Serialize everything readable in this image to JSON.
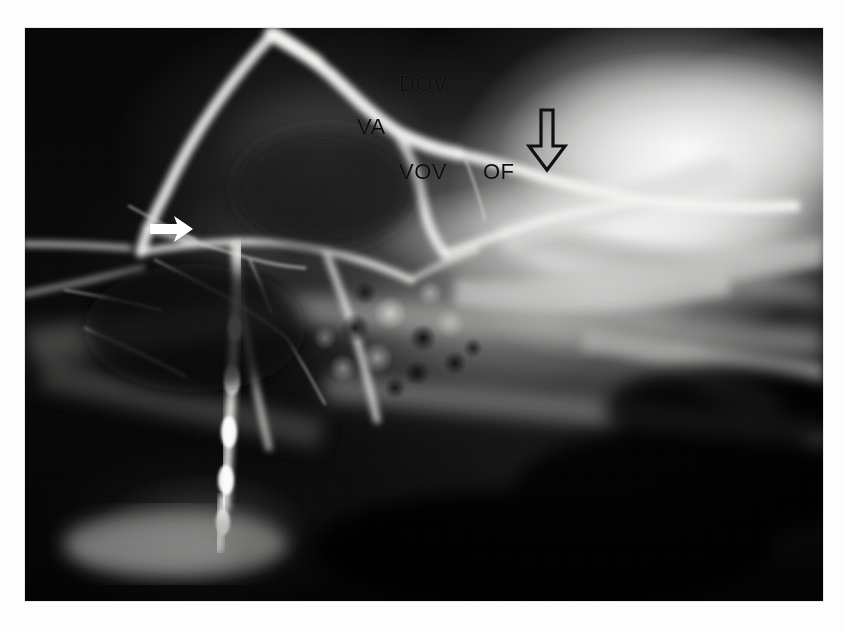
{
  "figure": {
    "kind": "radiograph",
    "modality": "venography / angiogram",
    "projection": "lateral head and neck",
    "background_color": "#ffffff",
    "plate_color": "#050505",
    "label_color": "#111111",
    "marker_color": "#ffffff"
  },
  "labels": [
    {
      "id": "dov",
      "text": "DOV",
      "x": 399,
      "y": 81,
      "meaning": "dorsal ophthalmic vein"
    },
    {
      "id": "va",
      "text": "VA",
      "x": 357,
      "y": 124,
      "meaning": "ventral anastomosis"
    },
    {
      "id": "vov",
      "text": "VOV",
      "x": 399,
      "y": 169,
      "meaning": "ventral ophthalmic vein"
    },
    {
      "id": "of",
      "text": "OF",
      "x": 483,
      "y": 169,
      "meaning": "orbital fissure"
    }
  ],
  "markers": [
    {
      "id": "open-arrow",
      "shape": "outlined-down-arrow",
      "x": 541,
      "y": 110,
      "width": 30,
      "height": 58,
      "fill": "none",
      "stroke": "#111111"
    },
    {
      "id": "solid-arrowhead",
      "shape": "solid-right-arrow",
      "x": 150,
      "y": 221,
      "width": 42,
      "height": 20,
      "fill": "#ffffff"
    }
  ],
  "plate": {
    "left": 25,
    "top": 28,
    "width": 798,
    "height": 573
  }
}
